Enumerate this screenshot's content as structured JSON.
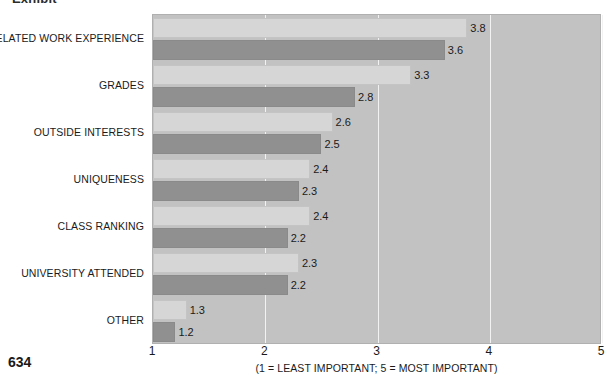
{
  "page_number": "634",
  "clipped_heading": "Exhibit",
  "legend": {
    "items": [
      {
        "label": "MBA",
        "color": "#909090",
        "swatch": "mba"
      },
      {
        "label": "BBA",
        "color": "#d6d6d6",
        "swatch": "bba"
      }
    ]
  },
  "axis": {
    "caption": "(1 = LEAST IMPORTANT; 5 = MOST IMPORTANT)",
    "ticks": [
      "1",
      "2",
      "3",
      "4",
      "5"
    ]
  },
  "chart_data": {
    "type": "bar",
    "orientation": "horizontal",
    "title": "",
    "subtitle": "",
    "xlabel": "(1 = LEAST IMPORTANT; 5 = MOST IMPORTANT)",
    "ylabel": "",
    "xlim": [
      1,
      5
    ],
    "xticks": [
      1,
      2,
      3,
      4,
      5
    ],
    "grid": true,
    "legend_position": "top-right",
    "categories": [
      "RELATED WORK EXPERIENCE",
      "GRADES",
      "OUTSIDE INTERESTS",
      "UNIQUENESS",
      "CLASS RANKING",
      "UNIVERSITY ATTENDED",
      "OTHER"
    ],
    "series": [
      {
        "name": "BBA",
        "color": "#d6d6d6",
        "values": [
          3.8,
          3.3,
          2.6,
          2.4,
          2.4,
          2.3,
          1.3
        ]
      },
      {
        "name": "MBA",
        "color": "#909090",
        "values": [
          3.6,
          2.8,
          2.5,
          2.3,
          2.2,
          2.2,
          1.2
        ]
      }
    ]
  }
}
